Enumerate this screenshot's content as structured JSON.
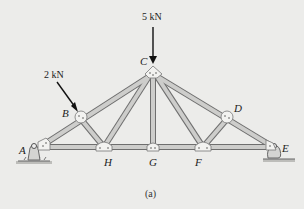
{
  "figure": {
    "caption": "(a)",
    "loads": [
      {
        "label": "5 kN",
        "joint": "C",
        "direction": "down"
      },
      {
        "label": "2 kN",
        "joint": "B",
        "direction": "perpendicular-to-top-chord"
      }
    ],
    "joints": {
      "A": "A",
      "B": "B",
      "C": "C",
      "D": "D",
      "E": "E",
      "F": "F",
      "G": "G",
      "H": "H"
    },
    "supports": {
      "A": "pin",
      "E": "roller"
    },
    "colors": {
      "member": "#cdcdcb",
      "member_edge": "#6e6e6e",
      "gusset": "#f2f2f0",
      "background": "#ececea"
    }
  }
}
